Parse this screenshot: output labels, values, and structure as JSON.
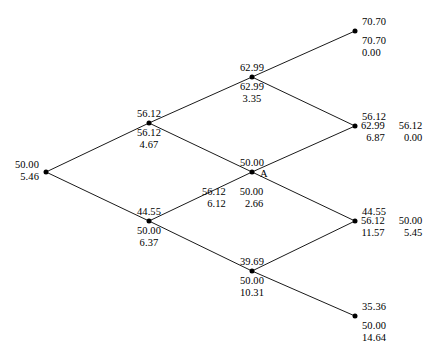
{
  "diagram": {
    "type": "binomial-lattice",
    "title": "",
    "node_marker": "filled-dot",
    "line_color": "#000000",
    "text_color": "#000000",
    "background": "#ffffff",
    "special_node_tag": "A",
    "nodes": [
      {
        "id": "root",
        "name": "root-node",
        "x": 46,
        "y": 172,
        "align": "right",
        "above": "",
        "below_lines": [
          "50.00",
          "5.46"
        ],
        "columns": []
      },
      {
        "id": "u",
        "name": "up-node-level1",
        "x": 149,
        "y": 123,
        "align": "center",
        "above": "56.12",
        "below_lines": [
          "56.12",
          "4.67"
        ],
        "columns": []
      },
      {
        "id": "d",
        "name": "down-node-level1",
        "x": 149,
        "y": 221,
        "align": "center",
        "above": "44.55",
        "below_lines": [
          "50.00",
          "6.37"
        ],
        "columns": []
      },
      {
        "id": "uu",
        "name": "up-up-node-level2",
        "x": 252,
        "y": 77,
        "align": "center",
        "above": "62.99",
        "below_lines": [
          "62.99",
          "3.35"
        ],
        "columns": []
      },
      {
        "id": "ud",
        "name": "middle-node-level2-A",
        "x": 252,
        "y": 172,
        "align": "center",
        "above": "50.00",
        "below_lines": [],
        "tag": "A",
        "columns": [
          {
            "label": "col-left",
            "lines": [
              "56.12",
              "6.12"
            ]
          },
          {
            "label": "col-right",
            "lines": [
              "50.00",
              "2.66"
            ]
          }
        ]
      },
      {
        "id": "dd",
        "name": "down-down-node-level2",
        "x": 252,
        "y": 271,
        "align": "center",
        "above": "39.69",
        "below_lines": [
          "50.00",
          "10.31"
        ],
        "columns": []
      },
      {
        "id": "t1",
        "name": "terminal-node-uuu",
        "x": 355,
        "y": 31,
        "align": "left",
        "above": "70.70",
        "below_lines": [
          "70.70",
          "0.00"
        ],
        "columns": []
      },
      {
        "id": "t2",
        "name": "terminal-node-uud",
        "x": 355,
        "y": 126,
        "align": "left",
        "above": "56.12",
        "below_lines": [],
        "columns": [
          {
            "label": "col-left",
            "lines": [
              "62.99",
              "6.87"
            ]
          },
          {
            "label": "col-right",
            "lines": [
              "56.12",
              "0.00"
            ]
          }
        ]
      },
      {
        "id": "t3",
        "name": "terminal-node-udd",
        "x": 355,
        "y": 221,
        "align": "left",
        "above": "44.55",
        "below_lines": [],
        "columns": [
          {
            "label": "col-left",
            "lines": [
              "56.12",
              "11.57"
            ]
          },
          {
            "label": "col-right",
            "lines": [
              "50.00",
              "5.45"
            ]
          }
        ]
      },
      {
        "id": "t4",
        "name": "terminal-node-ddd",
        "x": 355,
        "y": 316,
        "align": "left",
        "above": "35.36",
        "below_lines": [
          "50.00",
          "14.64"
        ],
        "columns": []
      }
    ],
    "edges": [
      {
        "name": "edge-root-up",
        "from": "root",
        "to": "u"
      },
      {
        "name": "edge-root-down",
        "from": "root",
        "to": "d"
      },
      {
        "name": "edge-u-uu",
        "from": "u",
        "to": "uu"
      },
      {
        "name": "edge-u-ud",
        "from": "u",
        "to": "ud"
      },
      {
        "name": "edge-d-ud",
        "from": "d",
        "to": "ud"
      },
      {
        "name": "edge-d-dd",
        "from": "d",
        "to": "dd"
      },
      {
        "name": "edge-uu-t1",
        "from": "uu",
        "to": "t1"
      },
      {
        "name": "edge-uu-t2",
        "from": "uu",
        "to": "t2"
      },
      {
        "name": "edge-ud-t2",
        "from": "ud",
        "to": "t2"
      },
      {
        "name": "edge-ud-t3",
        "from": "ud",
        "to": "t3"
      },
      {
        "name": "edge-dd-t3",
        "from": "dd",
        "to": "t3"
      },
      {
        "name": "edge-dd-t4",
        "from": "dd",
        "to": "t4"
      }
    ]
  },
  "chart_data": {
    "type": "tree",
    "levels": 3,
    "nodes": [
      {
        "id": "root",
        "asset_price": 50.0,
        "values": [
          50.0,
          5.46
        ]
      },
      {
        "id": "u",
        "asset_price": 56.12,
        "values": [
          56.12,
          4.67
        ]
      },
      {
        "id": "d",
        "asset_price": 44.55,
        "values": [
          50.0,
          6.37
        ]
      },
      {
        "id": "uu",
        "asset_price": 62.99,
        "values": [
          62.99,
          3.35
        ]
      },
      {
        "id": "ud",
        "asset_price": 50.0,
        "values": [
          56.12,
          6.12,
          50.0,
          2.66
        ],
        "tag": "A"
      },
      {
        "id": "dd",
        "asset_price": 39.69,
        "values": [
          50.0,
          10.31
        ]
      },
      {
        "id": "t1",
        "asset_price": 70.7,
        "values": [
          70.7,
          0.0
        ]
      },
      {
        "id": "t2",
        "asset_price": 56.12,
        "values": [
          62.99,
          6.87,
          56.12,
          0.0
        ]
      },
      {
        "id": "t3",
        "asset_price": 44.55,
        "values": [
          56.12,
          11.57,
          50.0,
          5.45
        ]
      },
      {
        "id": "t4",
        "asset_price": 35.36,
        "values": [
          50.0,
          14.64
        ]
      }
    ]
  }
}
